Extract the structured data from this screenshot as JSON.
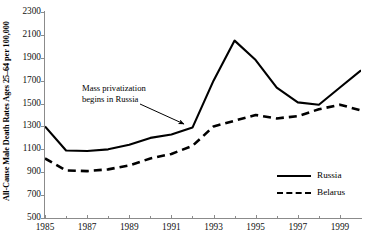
{
  "chart_data": {
    "type": "line",
    "title": "",
    "xlabel": "",
    "ylabel": "All-Cause Male Death Rates Ages 25–64 per 100,000",
    "xlim": [
      1985,
      2000
    ],
    "ylim": [
      500,
      2300
    ],
    "ytick_step": 200,
    "xtick_step": 2,
    "grid": false,
    "legend_position": "bottom-right",
    "yticks": [
      2300,
      2100,
      1900,
      1700,
      1500,
      1300,
      1100,
      900,
      700,
      500
    ],
    "xticks": [
      1985,
      1987,
      1989,
      1991,
      1993,
      1995,
      1997,
      1999
    ],
    "x": [
      1985,
      1986,
      1987,
      1988,
      1989,
      1990,
      1991,
      1992,
      1993,
      1994,
      1995,
      1996,
      1997,
      1998,
      1999,
      2000
    ],
    "series": [
      {
        "name": "Russia",
        "style": "solid",
        "color": "#000000",
        "values": [
          1300,
          1090,
          1085,
          1100,
          1140,
          1200,
          1230,
          1290,
          1700,
          2050,
          1880,
          1640,
          1510,
          1490,
          1640,
          1790
        ]
      },
      {
        "name": "Belarus",
        "style": "dashed",
        "color": "#000000",
        "values": [
          1020,
          915,
          910,
          925,
          960,
          1020,
          1060,
          1130,
          1300,
          1350,
          1400,
          1370,
          1390,
          1450,
          1490,
          1440
        ]
      }
    ],
    "annotations": [
      {
        "text_line1": "Mass privatization",
        "text_line2": "begins in Russia",
        "arrow_from_x": 1991.0,
        "arrow_from_y": 1640,
        "arrow_to_x": 1992.0,
        "arrow_to_y": 1430
      }
    ]
  },
  "legend": {
    "items": [
      {
        "label": "Russia",
        "style": "solid"
      },
      {
        "label": "Belarus",
        "style": "dashed"
      }
    ]
  }
}
